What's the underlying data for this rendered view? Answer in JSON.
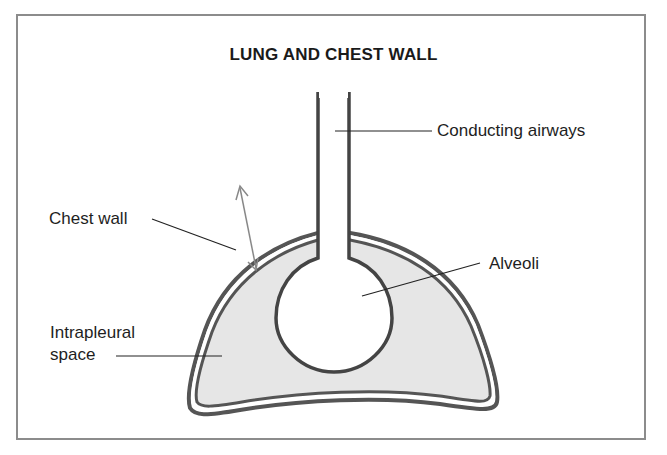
{
  "title": "LUNG AND CHEST WALL",
  "labels": {
    "conducting_airways": "Conducting airways",
    "chest_wall": "Chest wall",
    "alveoli": "Alveoli",
    "intrapleural_line1": "Intrapleural",
    "intrapleural_line2": "space"
  },
  "colors": {
    "outline": "#555555",
    "fill": "#e6e6e6",
    "frame": "#8c8c8c",
    "text": "#1e1e1e",
    "arrow": "#888888"
  }
}
